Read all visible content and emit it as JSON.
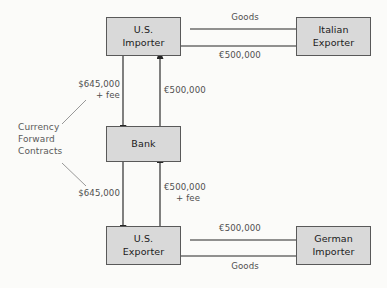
{
  "diagram": {
    "colors": {
      "background": "#fbfbf9",
      "box_fill": "#d9d9d9",
      "box_border": "#595959",
      "arrow": "#262626",
      "label_text": "#4f4f4f",
      "node_text": "#1a1a1a",
      "leader_line": "#8c8c8c"
    },
    "nodes": [
      {
        "id": "us-importer",
        "line1": "U.S.",
        "line2": "Importer"
      },
      {
        "id": "italian-exporter",
        "line1": "Italian",
        "line2": "Exporter"
      },
      {
        "id": "bank",
        "line1": "Bank",
        "line2": ""
      },
      {
        "id": "us-exporter",
        "line1": "U.S.",
        "line2": "Exporter"
      },
      {
        "id": "german-importer",
        "line1": "German",
        "line2": "Importer"
      }
    ],
    "labels": {
      "goods_top": "Goods",
      "euro_top": "€500,000",
      "usd_importer_bank_line1": "$645,000",
      "usd_importer_bank_line2": "+ fee",
      "euro_bank_importer": "€500,000",
      "annotation_line1": "Currency",
      "annotation_line2": "Forward",
      "annotation_line3": "Contracts",
      "usd_bank_exporter": "$645,000",
      "euro_exporter_bank_line1": "€500,000",
      "euro_exporter_bank_line2": "+ fee",
      "euro_bottom": "€500,000",
      "goods_bottom": "Goods"
    },
    "flows": [
      {
        "id": "goods-italy-to-us",
        "from": "italian-exporter",
        "to": "us-importer",
        "label": "Goods"
      },
      {
        "id": "euro-us-to-italy",
        "from": "us-importer",
        "to": "italian-exporter",
        "label": "€500,000"
      },
      {
        "id": "usd-importer-to-bank",
        "from": "us-importer",
        "to": "bank",
        "label": "$645,000 + fee"
      },
      {
        "id": "euro-bank-to-importer",
        "from": "bank",
        "to": "us-importer",
        "label": "€500,000"
      },
      {
        "id": "usd-bank-to-exporter",
        "from": "bank",
        "to": "us-exporter",
        "label": "$645,000"
      },
      {
        "id": "euro-exporter-to-bank",
        "from": "us-exporter",
        "to": "bank",
        "label": "€500,000 + fee"
      },
      {
        "id": "euro-germany-to-us",
        "from": "german-importer",
        "to": "us-exporter",
        "label": "€500,000"
      },
      {
        "id": "goods-us-to-germany",
        "from": "us-exporter",
        "to": "german-importer",
        "label": "Goods"
      }
    ]
  }
}
